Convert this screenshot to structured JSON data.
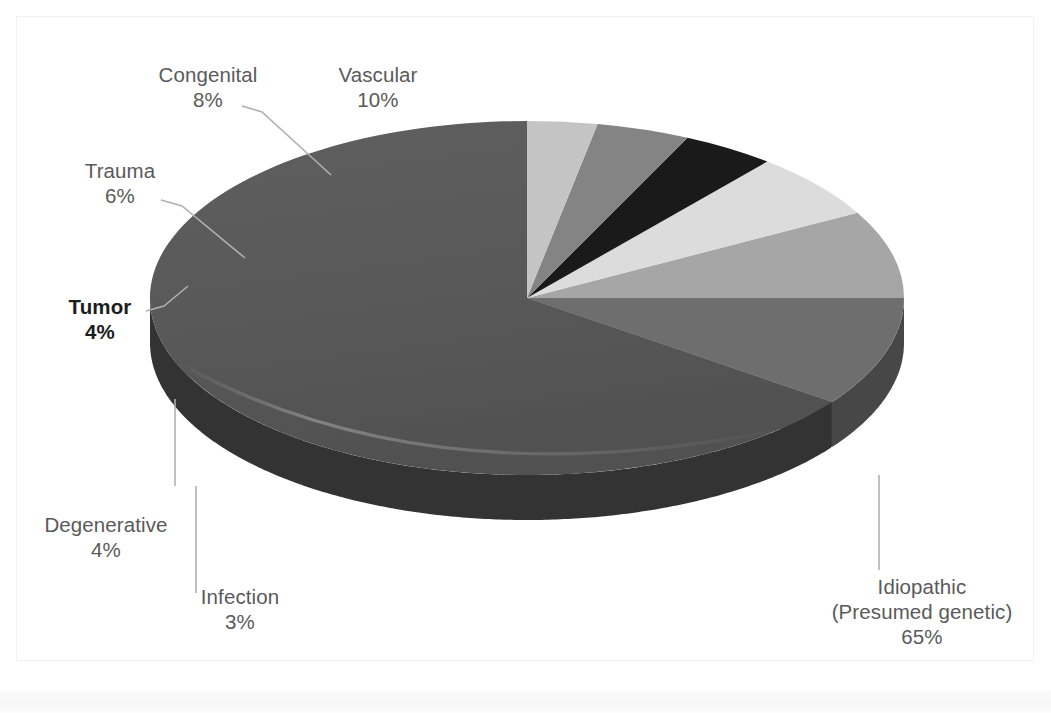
{
  "figure": {
    "background_color": "#ffffff",
    "label_color": "#5a5a5a",
    "emphasis_label_color": "#1c1c1c",
    "leader_line_color": "#b3b3b3"
  },
  "chart_data": {
    "type": "pie",
    "title": "",
    "subtitle": "",
    "xlabel": "",
    "ylabel": "",
    "legend_position": "none",
    "grid": false,
    "three_d": true,
    "start_angle_deg": 0,
    "direction": "counterclockwise",
    "total_percent": 100,
    "categories": [
      "Idiopathic (Presumed genetic)",
      "Vascular",
      "Congenital",
      "Trauma",
      "Tumor",
      "Degenerative",
      "Infection"
    ],
    "values": [
      65,
      10,
      8,
      6,
      4,
      4,
      3
    ],
    "slices": [
      {
        "name": "Idiopathic",
        "label_line1": "Idiopathic",
        "label_line2": "(Presumed genetic)",
        "percent_text": "65%",
        "value": 65,
        "top_color": "#595959",
        "side_color": "#333333",
        "emphasis": false
      },
      {
        "name": "Vascular",
        "label_line1": "Vascular",
        "label_line2": "",
        "percent_text": "10%",
        "value": 10,
        "top_color": "#6e6e6e",
        "side_color": "#474747",
        "emphasis": false
      },
      {
        "name": "Congenital",
        "label_line1": "Congenital",
        "label_line2": "",
        "percent_text": "8%",
        "value": 8,
        "top_color": "#a6a6a6",
        "side_color": "#737373",
        "emphasis": false
      },
      {
        "name": "Trauma",
        "label_line1": "Trauma",
        "label_line2": "",
        "percent_text": "6%",
        "value": 6,
        "top_color": "#dcdcdc",
        "side_color": "#a8a8a8",
        "emphasis": false
      },
      {
        "name": "Tumor",
        "label_line1": "Tumor",
        "label_line2": "",
        "percent_text": "4%",
        "value": 4,
        "top_color": "#1a1a1a",
        "side_color": "#0d0d0d",
        "emphasis": true
      },
      {
        "name": "Degenerative",
        "label_line1": "Degenerative",
        "label_line2": "",
        "percent_text": "4%",
        "value": 4,
        "top_color": "#848484",
        "side_color": "#5c5c5c",
        "emphasis": false
      },
      {
        "name": "Infection",
        "label_line1": "Infection",
        "label_line2": "",
        "percent_text": "3%",
        "value": 3,
        "top_color": "#c4c4c4",
        "side_color": "#949494",
        "emphasis": false
      }
    ]
  }
}
